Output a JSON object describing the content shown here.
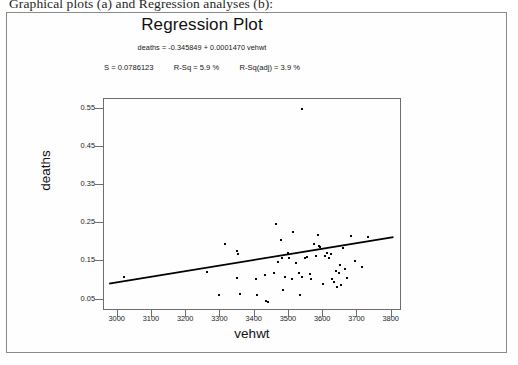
{
  "caption": "Graphical plots (a) and Regression analyses (b):",
  "chart_data": {
    "type": "scatter",
    "title": "Regression Plot",
    "equation": "deaths = -0.345849 + 0.0001470 vehwt",
    "stats": {
      "s_label": "S = 0.0786123",
      "rsq_label": "R-Sq = 5.9 %",
      "rsq_adj_label": "R-Sq(adj) = 3.9 %",
      "s": 0.0786123,
      "r_squared_pct": 5.9,
      "r_squared_adj_pct": 3.9
    },
    "xlabel": "vehwt",
    "ylabel": "deaths",
    "xlim": [
      2960,
      3830
    ],
    "ylim": [
      0.02,
      0.575
    ],
    "grid": false,
    "legend": "none",
    "xticks": [
      3000,
      3100,
      3200,
      3300,
      3400,
      3500,
      3600,
      3700,
      3800
    ],
    "xtick_labels": [
      "3000",
      "3100",
      "3200",
      "3300",
      "3400",
      "3500",
      "3600",
      "3700",
      "3800"
    ],
    "yticks": [
      0.05,
      0.15,
      0.25,
      0.35,
      0.45,
      0.55
    ],
    "ytick_labels": [
      "0.05",
      "0.15",
      "0.25",
      "0.35",
      "0.45",
      "0.55"
    ],
    "fit_line": {
      "intercept": -0.345849,
      "slope": 0.000147,
      "x_start": 2975,
      "x_end": 3805
    },
    "points": [
      [
        3017,
        0.108
      ],
      [
        3262,
        0.122
      ],
      [
        3312,
        0.196
      ],
      [
        3295,
        0.063
      ],
      [
        3348,
        0.178
      ],
      [
        3352,
        0.17
      ],
      [
        3347,
        0.106
      ],
      [
        3356,
        0.064
      ],
      [
        3404,
        0.104
      ],
      [
        3407,
        0.063
      ],
      [
        3431,
        0.113
      ],
      [
        3434,
        0.046
      ],
      [
        3440,
        0.043
      ],
      [
        3455,
        0.119
      ],
      [
        3463,
        0.248
      ],
      [
        3469,
        0.147
      ],
      [
        3478,
        0.206
      ],
      [
        3480,
        0.16
      ],
      [
        3482,
        0.076
      ],
      [
        3489,
        0.11
      ],
      [
        3497,
        0.171
      ],
      [
        3501,
        0.159
      ],
      [
        3509,
        0.104
      ],
      [
        3513,
        0.227
      ],
      [
        3521,
        0.146
      ],
      [
        3528,
        0.12
      ],
      [
        3531,
        0.063
      ],
      [
        3538,
        0.548
      ],
      [
        3539,
        0.108
      ],
      [
        3546,
        0.16
      ],
      [
        3553,
        0.161
      ],
      [
        3561,
        0.118
      ],
      [
        3565,
        0.104
      ],
      [
        3573,
        0.196
      ],
      [
        3578,
        0.163
      ],
      [
        3586,
        0.219
      ],
      [
        3589,
        0.19
      ],
      [
        3592,
        0.188
      ],
      [
        3599,
        0.09
      ],
      [
        3605,
        0.165
      ],
      [
        3611,
        0.172
      ],
      [
        3618,
        0.16
      ],
      [
        3624,
        0.168
      ],
      [
        3627,
        0.105
      ],
      [
        3631,
        0.097
      ],
      [
        3638,
        0.126
      ],
      [
        3641,
        0.084
      ],
      [
        3645,
        0.12
      ],
      [
        3648,
        0.141
      ],
      [
        3652,
        0.089
      ],
      [
        3659,
        0.186
      ],
      [
        3663,
        0.131
      ],
      [
        3670,
        0.106
      ],
      [
        3682,
        0.216
      ],
      [
        3694,
        0.152
      ],
      [
        3712,
        0.136
      ],
      [
        3730,
        0.215
      ]
    ]
  }
}
